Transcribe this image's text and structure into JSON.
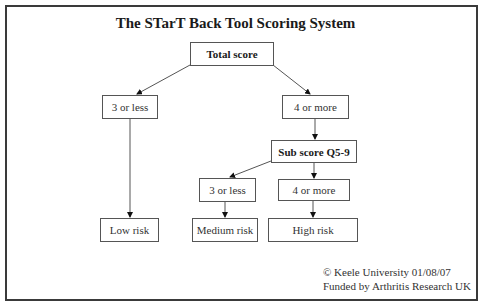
{
  "diagram": {
    "title": "The STarT Back Tool Scoring System",
    "nodes": {
      "total_score": "Total score",
      "left_low": "3 or less",
      "right_high": "4 or more",
      "sub_score": "Sub score Q5-9",
      "sub_low": "3 or less",
      "sub_high": "4 or more",
      "low_risk": "Low risk",
      "medium_risk": "Medium risk",
      "high_risk": "High risk"
    },
    "edges": [
      {
        "from": "total_score",
        "to": "left_low"
      },
      {
        "from": "total_score",
        "to": "right_high"
      },
      {
        "from": "left_low",
        "to": "low_risk"
      },
      {
        "from": "right_high",
        "to": "sub_score"
      },
      {
        "from": "sub_score",
        "to": "sub_low"
      },
      {
        "from": "sub_score",
        "to": "sub_high"
      },
      {
        "from": "sub_low",
        "to": "medium_risk"
      },
      {
        "from": "sub_high",
        "to": "high_risk"
      }
    ],
    "footer": {
      "copyright": "© Keele University 01/08/07",
      "funding": "Funded by Arthritis Research UK"
    }
  }
}
